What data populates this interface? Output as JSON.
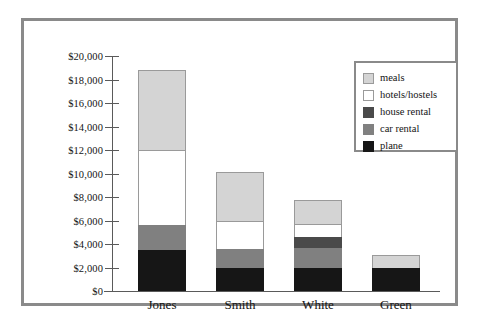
{
  "chart_data": {
    "type": "bar",
    "subtype": "stacked-bar",
    "title": "",
    "xlabel": "",
    "ylabel": "",
    "categories": [
      "Jones",
      "Smith",
      "White",
      "Green"
    ],
    "series": [
      {
        "name": "plane",
        "color": "#161616",
        "values": [
          3500,
          1960,
          1960,
          1950
        ]
      },
      {
        "name": "car rental",
        "color": "#808080",
        "values": [
          2100,
          1640,
          1700,
          0
        ]
      },
      {
        "name": "house rental",
        "color": "#4a4a4a",
        "values": [
          0,
          0,
          900,
          0
        ]
      },
      {
        "name": "hotels/hostels",
        "color": "#ffffff",
        "values": [
          6400,
          2400,
          1150,
          0
        ]
      },
      {
        "name": "meals",
        "color": "#d4d4d4",
        "values": [
          6800,
          4100,
          2000,
          1100
        ]
      }
    ],
    "totals": [
      18800,
      10100,
      7710,
      3050
    ],
    "ylim": [
      0,
      20000
    ],
    "ytick_values": [
      0,
      2000,
      4000,
      6000,
      8000,
      10000,
      12000,
      14000,
      16000,
      18000,
      20000
    ],
    "ytick_labels": [
      "$0",
      "$2,000",
      "$4,000",
      "$6,000",
      "$8,000",
      "$10,000",
      "$12,000",
      "$14,000",
      "$16,000",
      "$18,000",
      "$20,000"
    ],
    "grid": false,
    "legend_position": "top-right",
    "legend_entries": [
      "meals",
      "hotels/hostels",
      "house rental",
      "car rental",
      "plane"
    ]
  },
  "legend": {
    "items": [
      {
        "label": "meals",
        "color": "#d4d4d4",
        "bordered": true
      },
      {
        "label": "hotels/hostels",
        "color": "#ffffff",
        "bordered": true
      },
      {
        "label": "house rental",
        "color": "#4a4a4a",
        "bordered": false
      },
      {
        "label": "car rental",
        "color": "#808080",
        "bordered": false
      },
      {
        "label": "plane",
        "color": "#161616",
        "bordered": false
      }
    ]
  },
  "colors": {
    "frame": "#8a8a8a",
    "axis": "#5a5a5a",
    "text": "#141414",
    "background": "#ffffff"
  }
}
